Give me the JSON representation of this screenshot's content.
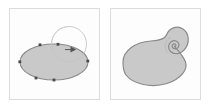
{
  "figure": {
    "title": "Spiralize path effect: before and after",
    "background_color": "#ffffff",
    "width": 211,
    "height": 108,
    "panel_count": 2
  },
  "style": {
    "panel_background": "#fdfdfd",
    "panel_border_color": "#dcdcdc",
    "shape_fill": "#c9c9c9",
    "shape_stroke": "#8a8a8a",
    "guide_stroke": "#c4c4c4",
    "node_color": "#4a4a4a",
    "arrow_color": "#555555"
  },
  "panels": [
    {
      "id": "before",
      "label": "Before",
      "description": "Filled ellipse with editable path nodes and a circular spiral guide overlapping its upper right side, marked with a direction arrowhead.",
      "shape": {
        "name": "ellipse",
        "center_x": 44,
        "center_y": 53,
        "radius_x": 34,
        "radius_y": 18,
        "fill": "#c9c9c9",
        "stroke": "#8a8a8a"
      },
      "guide": {
        "name": "spiral-guide-circle",
        "center_x": 59,
        "center_y": 35,
        "radius": 17,
        "stroke": "#c4c4c4",
        "stroke_width": 0.9
      },
      "arrow": {
        "name": "direction-arrowhead",
        "x": 64,
        "y": 41,
        "direction": "right",
        "color": "#555555"
      },
      "nodes": [
        {
          "x": 10,
          "y": 53
        },
        {
          "x": 30,
          "y": 36
        },
        {
          "x": 48,
          "y": 35
        },
        {
          "x": 78,
          "y": 52
        },
        {
          "x": 44,
          "y": 71
        },
        {
          "x": 26,
          "y": 69
        }
      ]
    },
    {
      "id": "after",
      "label": "After",
      "description": "The same blob deformed so its upper right edge rolls inward into a tight logarithmic spiral, producing a snail-shell silhouette.",
      "shape": {
        "name": "spiral-blob",
        "fill": "#c9c9c9",
        "stroke": "#8a8a8a"
      },
      "spiral": {
        "name": "inward-spiral",
        "center_x": 58,
        "center_y": 35,
        "turns": 2.25,
        "winding": "clockwise-inward",
        "start_radius": 22,
        "end_radius": 1.5
      }
    }
  ]
}
